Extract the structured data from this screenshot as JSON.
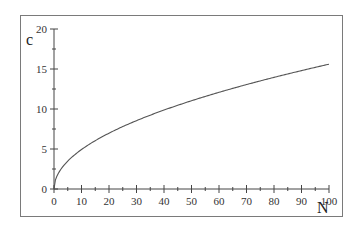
{
  "chart_data": {
    "type": "line",
    "title": "",
    "xlabel": "N",
    "ylabel": "c",
    "xlim": [
      0,
      100
    ],
    "ylim": [
      0,
      20
    ],
    "grid": false,
    "legend": null,
    "x_ticks": [
      0,
      10,
      20,
      30,
      40,
      50,
      60,
      70,
      80,
      90,
      100
    ],
    "x_minor_ticks": [
      5,
      15,
      25,
      35,
      45,
      55,
      65,
      75,
      85,
      95
    ],
    "y_ticks": [
      0,
      5,
      10,
      15,
      20
    ],
    "y_minor_ticks": [
      2.5,
      7.5,
      12.5,
      17.5
    ],
    "x_tick_labels": [
      "0",
      "10",
      "20",
      "30",
      "40",
      "50",
      "60",
      "70",
      "80",
      "90",
      "100"
    ],
    "y_tick_labels": [
      "0",
      "5",
      "10",
      "15",
      "20"
    ],
    "series": [
      {
        "name": "c(N)",
        "color": "#555555",
        "x": [
          0,
          1,
          2,
          5,
          10,
          20,
          30,
          40,
          50,
          60,
          70,
          80,
          90,
          100
        ],
        "values": [
          0,
          1.56,
          2.21,
          3.49,
          4.93,
          6.98,
          8.54,
          9.87,
          11.03,
          12.08,
          13.05,
          13.95,
          14.8,
          15.6
        ]
      }
    ]
  }
}
